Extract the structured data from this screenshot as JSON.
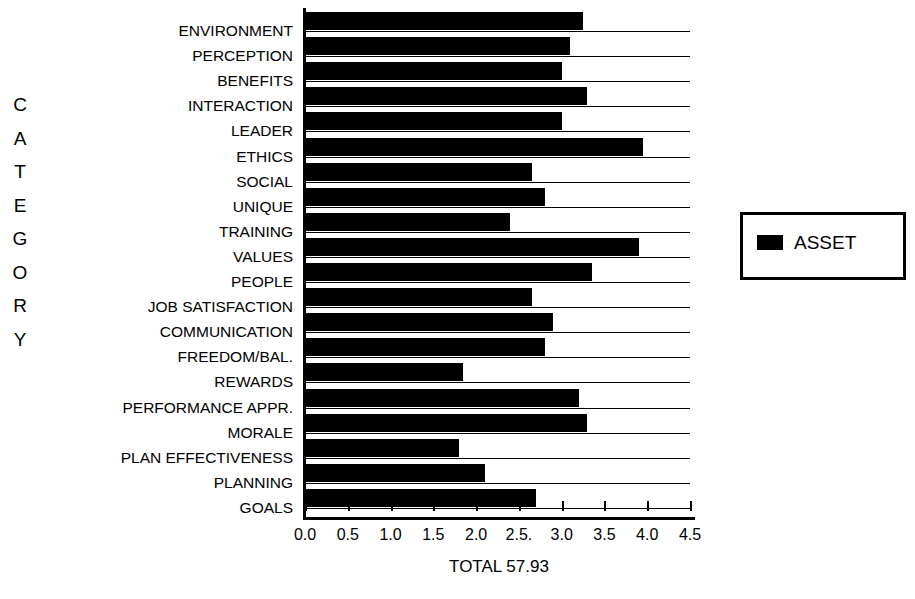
{
  "chart_data": {
    "type": "bar",
    "orientation": "horizontal",
    "title": "",
    "xlabel": "",
    "ylabel": "CATEGORY",
    "caption": "TOTAL 57.93",
    "xlim": [
      0.0,
      4.5
    ],
    "grid": false,
    "legend_position": "right",
    "legend": [
      {
        "name": "ASSET",
        "color": "#000000"
      }
    ],
    "xticks": [
      0.0,
      0.5,
      1.0,
      1.5,
      2.0,
      2.5,
      3.0,
      3.5,
      4.0,
      4.5
    ],
    "xticklabels": [
      "0.0",
      "0.5",
      "1.0",
      "1.5",
      "2.0",
      "2.5.",
      "3.0",
      "3.5",
      "4.0",
      "4.5"
    ],
    "categories": [
      "ENVIRONMENT",
      "PERCEPTION",
      "BENEFITS",
      "INTERACTION",
      "LEADER",
      "ETHICS",
      "SOCIAL",
      "UNIQUE",
      "TRAINING",
      "VALUES",
      "PEOPLE",
      "JOB SATISFACTION",
      "COMMUNICATION",
      "FREEDOM/BAL.",
      "REWARDS",
      "PERFORMANCE APPR.",
      "MORALE",
      "PLAN EFFECTIVENESS",
      "PLANNING",
      "GOALS"
    ],
    "series": [
      {
        "name": "ASSET",
        "color": "#000000",
        "values": [
          3.25,
          3.1,
          3.0,
          3.3,
          3.0,
          3.95,
          2.65,
          2.8,
          2.4,
          3.9,
          3.35,
          2.65,
          2.9,
          2.8,
          1.85,
          3.2,
          3.3,
          1.8,
          2.1,
          2.7
        ]
      }
    ]
  },
  "axis_title_letters": [
    "C",
    "A",
    "T",
    "E",
    "G",
    "O",
    "R",
    "Y"
  ],
  "legend_box": {
    "label": "ASSET",
    "swatch_color": "#000000"
  },
  "total": {
    "text": "TOTAL 57.93"
  }
}
